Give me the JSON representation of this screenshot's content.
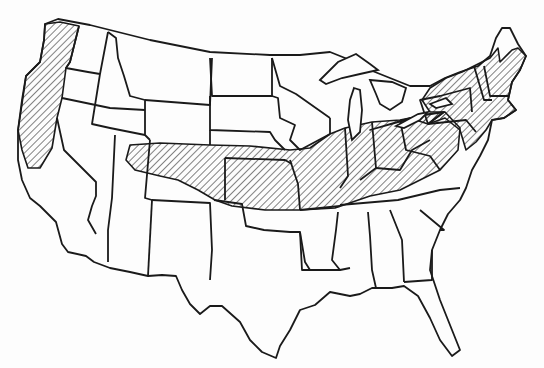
{
  "map": {
    "title": "",
    "region": "Contiguous United States",
    "style": "black-and-white line map with state boundaries",
    "hatch_color": "#1a1a1a",
    "background": "#fdfdfd",
    "hatched_areas": [
      {
        "name": "pacific-coast",
        "states": [
          "Washington (western)",
          "Oregon (western)",
          "California (northern coast)"
        ]
      },
      {
        "name": "central-band",
        "states": [
          "Colorado (northern/eastern)",
          "Kansas",
          "Nebraska (southern)",
          "Missouri",
          "Iowa (southern)",
          "Illinois",
          "Indiana",
          "Ohio",
          "Kentucky",
          "Tennessee (northern)",
          "West Virginia",
          "Virginia",
          "Maryland"
        ]
      },
      {
        "name": "northeast",
        "states": [
          "Pennsylvania",
          "New York",
          "New Jersey",
          "Connecticut",
          "Rhode Island",
          "Massachusetts",
          "Vermont",
          "New Hampshire",
          "Maine (southern)",
          "Delaware"
        ]
      },
      {
        "name": "michigan-south",
        "states": [
          "Michigan (southern edge)"
        ]
      }
    ],
    "unhatched_areas": [
      "Mountain West",
      "Southwest",
      "Texas",
      "Deep South",
      "Florida",
      "Upper Midwest",
      "Northern Plains"
    ]
  }
}
